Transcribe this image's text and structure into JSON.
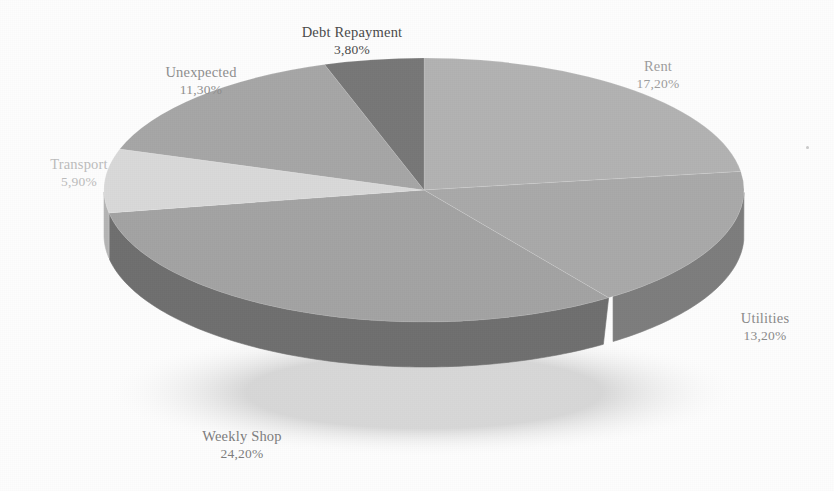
{
  "chart_data": {
    "type": "pie",
    "title": "",
    "subtitle": "",
    "xlabel": "",
    "ylabel": "",
    "legend_position": "none",
    "grid": false,
    "three_d": true,
    "value_suffix": "%",
    "decimal_separator": ",",
    "labels_outside": true,
    "categories": [
      "Rent",
      "Utilities",
      "Weekly Shop",
      "Transport",
      "Unexpected",
      "Debt Repayment"
    ],
    "values": [
      17.2,
      13.2,
      24.2,
      5.9,
      11.3,
      3.8
    ],
    "value_texts": [
      "17,20%",
      "13,20%",
      "24,20%",
      "5,90%",
      "11,30%",
      "3,80%"
    ],
    "slice_colors": [
      "#b2b2b2",
      "#a9a9a9",
      "#a3a3a3",
      "#d9d9d9",
      "#a6a6a6",
      "#777777"
    ],
    "side_colors": [
      "#8f8f8f",
      "#7d7d7d",
      "#6f6f6f",
      "#b4b4b4",
      "#868686",
      "#5c5c5c"
    ],
    "slices": [
      {
        "name": "Rent",
        "value": 17.2,
        "value_text": "17,20%",
        "color": "#b2b2b2",
        "side_color": "#8f8f8f"
      },
      {
        "name": "Utilities",
        "value": 13.2,
        "value_text": "13,20%",
        "color": "#a9a9a9",
        "side_color": "#7d7d7d"
      },
      {
        "name": "Weekly Shop",
        "value": 24.2,
        "value_text": "24,20%",
        "color": "#a3a3a3",
        "side_color": "#6f6f6f"
      },
      {
        "name": "Transport",
        "value": 5.9,
        "value_text": "5,90%",
        "color": "#d9d9d9",
        "side_color": "#b4b4b4"
      },
      {
        "name": "Unexpected",
        "value": 11.3,
        "value_text": "11,30%",
        "color": "#a6a6a6",
        "side_color": "#868686"
      },
      {
        "name": "Debt Repayment",
        "value": 3.8,
        "value_text": "3,80%",
        "color": "#777777",
        "side_color": "#5c5c5c"
      }
    ]
  },
  "labels": {
    "debt_repayment": {
      "name": "Debt Repayment",
      "value": "3,80%"
    },
    "unexpected": {
      "name": "Unexpected",
      "value": "11,30%"
    },
    "transport": {
      "name": "Transport",
      "value": "5,90%"
    },
    "rent": {
      "name": "Rent",
      "value": "17,20%"
    },
    "utilities": {
      "name": "Utilities",
      "value": "13,20%"
    },
    "weekly_shop": {
      "name": "Weekly Shop",
      "value": "24,20%"
    }
  }
}
